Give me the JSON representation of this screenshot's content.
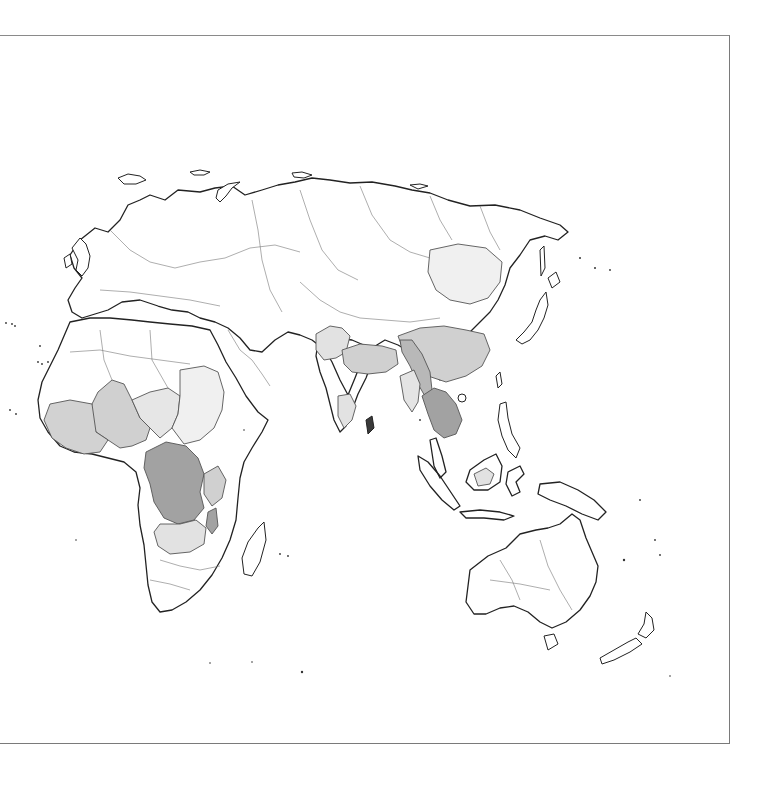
{
  "map": {
    "type": "choropleth",
    "projection": "world-region (Afro-Eurasia & Oceania)",
    "frame": {
      "border_color": "#7a7a7a",
      "top": 35,
      "right": 729,
      "bottom": 743
    },
    "legend": null,
    "title": null,
    "shades": {
      "none": "#ffffff",
      "very_light": "#f0f0f0",
      "light": "#e2e2e2",
      "medium": "#d0d0d0",
      "dark": "#b8b8b8",
      "darkest": "#a2a2a2"
    },
    "regions": [
      {
        "name": "Europe",
        "shade": "none"
      },
      {
        "name": "Russia / North Asia",
        "shade": "none"
      },
      {
        "name": "North Africa",
        "shade": "none"
      },
      {
        "name": "Middle East",
        "shade": "none"
      },
      {
        "name": "West Africa coast",
        "shade": "medium"
      },
      {
        "name": "Mali / Niger (Sahel)",
        "shade": "medium"
      },
      {
        "name": "Chad",
        "shade": "light"
      },
      {
        "name": "Sudan",
        "shade": "very_light"
      },
      {
        "name": "DR Congo",
        "shade": "darkest"
      },
      {
        "name": "Tanzania / Uganda",
        "shade": "medium"
      },
      {
        "name": "Malawi",
        "shade": "darkest"
      },
      {
        "name": "Zambia / Angola south",
        "shade": "light"
      },
      {
        "name": "Southern Africa",
        "shade": "none"
      },
      {
        "name": "Madagascar",
        "shade": "none"
      },
      {
        "name": "Pakistan / NW India",
        "shade": "light"
      },
      {
        "name": "Central India",
        "shade": "medium"
      },
      {
        "name": "South India",
        "shade": "light"
      },
      {
        "name": "Myanmar",
        "shade": "light"
      },
      {
        "name": "South China",
        "shade": "medium"
      },
      {
        "name": "Yunnan corridor",
        "shade": "dark"
      },
      {
        "name": "Thailand / Cambodia / Laos",
        "shade": "darkest"
      },
      {
        "name": "North-East China",
        "shade": "very_light"
      },
      {
        "name": "Japan / Korea",
        "shade": "none"
      },
      {
        "name": "Indonesia / Philippines",
        "shade": "none"
      },
      {
        "name": "Borneo interior",
        "shade": "light"
      },
      {
        "name": "Australia",
        "shade": "none"
      },
      {
        "name": "New Zealand",
        "shade": "none"
      }
    ]
  }
}
